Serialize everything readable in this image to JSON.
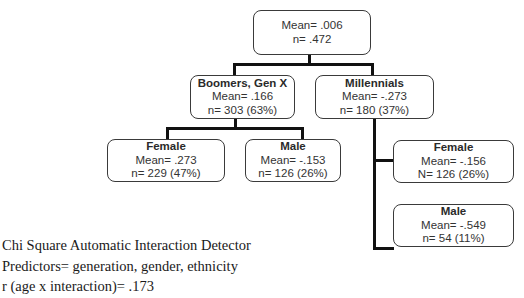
{
  "tree": {
    "root": {
      "mean": "Mean= .006",
      "n": "n= .472"
    },
    "boomers_genx": {
      "title": "Boomers, Gen X",
      "mean": "Mean= .166",
      "n": "n= 303 (63%)"
    },
    "millennials": {
      "title": "Millennials",
      "mean": "Mean= -.273",
      "n": "n= 180 (37%)"
    },
    "boomers_female": {
      "title": "Female",
      "mean": "Mean= .273",
      "n": "n= 229 (47%)"
    },
    "boomers_male": {
      "title": "Male",
      "mean": "Mean= -.153",
      "n": "n= 126 (26%)"
    },
    "millennials_female": {
      "title": "Female",
      "mean": "Mean= -.156",
      "n": "N= 126 (26%)"
    },
    "millennials_male": {
      "title": "Male",
      "mean": "Mean= -.549",
      "n": "n= 54 (11%)"
    }
  },
  "notes": {
    "line1": "Chi Square Automatic Interaction Detector",
    "line2": "Predictors= generation, gender, ethnicity",
    "line3": "r (age x interaction)= .173"
  }
}
